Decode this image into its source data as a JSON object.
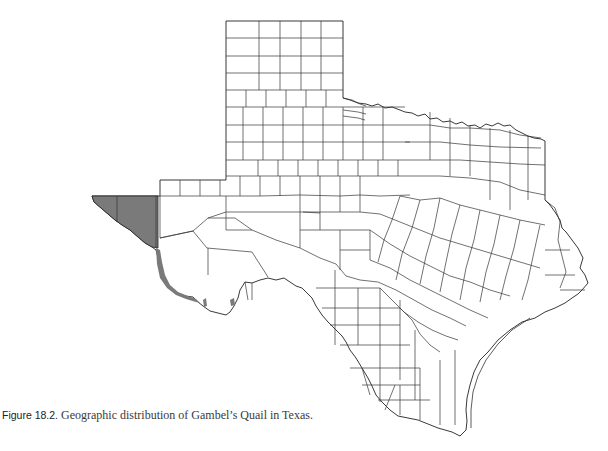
{
  "figure": {
    "label": "Figure 18.2.",
    "caption": " Geographic distribution of Gambel’s Quail in Texas."
  },
  "map": {
    "region": "Texas",
    "subject": "Gambel's Quail",
    "layer": "county boundaries",
    "legend": [],
    "colors": {
      "range_fill": "#7a7a7a",
      "county_fill": "#ffffff",
      "boundary_stroke": "#333333",
      "background": "#ffffff"
    },
    "highlighted_region": "far west Texas (El Paso / Hudspeth counties and narrow Rio Grande strip)"
  }
}
